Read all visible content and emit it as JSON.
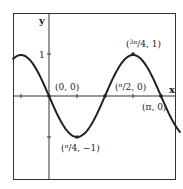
{
  "chart_data": {
    "type": "line",
    "title": "",
    "function": "y = -sin(2x)",
    "xlabel": "x",
    "ylabel": "y",
    "xlim": [
      -1.2,
      1.15
    ],
    "ylim": [
      -1.8,
      1.3
    ],
    "y_ticks": [
      {
        "value": 1,
        "label": "1"
      },
      {
        "value": -1,
        "label": ""
      }
    ],
    "x_ticks": [
      -0.7854,
      0.7854,
      1.5708,
      2.3562,
      3.1416
    ],
    "grid": false,
    "series": [
      {
        "name": "y = -sin(2x)",
        "x_range": [
          -1.02,
          3.69
        ]
      }
    ],
    "points": [
      {
        "label": "(0, 0)",
        "x": 0,
        "y": 0
      },
      {
        "label": "(π/4, −1)",
        "x": 0.7854,
        "y": -1
      },
      {
        "label": "(π/2, 0)",
        "x": 1.5708,
        "y": 0
      },
      {
        "label": "(3π/4, 1)",
        "x": 2.3562,
        "y": 1
      },
      {
        "label": "(π, 0)",
        "x": 3.1416,
        "y": 0
      }
    ]
  },
  "labels": {
    "x_axis": "x",
    "y_axis": "y",
    "y_tick_1": "1",
    "p0": "(0, 0)",
    "p1_num": "π",
    "p1_rest": "/4, −1)",
    "p2_num": "π",
    "p2_rest": "/2, 0)",
    "p3_num": "3π",
    "p3_rest": "/4, 1)",
    "p4": "(π, 0)",
    "open_paren": "("
  }
}
